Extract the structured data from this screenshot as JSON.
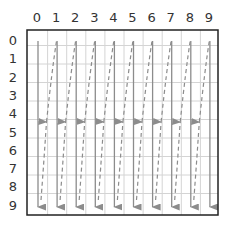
{
  "diagram": {
    "type": "grid-scan-order",
    "columns": 10,
    "rows": 10,
    "col_labels": [
      "0",
      "1",
      "2",
      "3",
      "4",
      "5",
      "6",
      "7",
      "8",
      "9"
    ],
    "row_labels": [
      "0",
      "1",
      "2",
      "3",
      "4",
      "5",
      "6",
      "7",
      "8",
      "9"
    ],
    "solid_arrows": {
      "count": 10,
      "direction": "down",
      "from_row": 0,
      "to_row": 9
    },
    "dashed_arrows": {
      "count": 9,
      "direction": "up",
      "from": "bottom of column k",
      "to": "top of column k+1"
    },
    "colors": {
      "border": "#222222",
      "grid": "#d4d4d4",
      "arrow": "#8c8c8c",
      "label": "#333333"
    }
  }
}
